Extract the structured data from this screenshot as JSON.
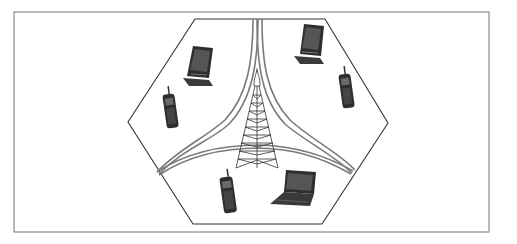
{
  "diagram": {
    "frame": {
      "x": 14,
      "y": 12,
      "w": 475,
      "h": 220,
      "stroke": "#8a8a8a"
    },
    "cell": {
      "shape": "hexagon",
      "points": [
        [
          195,
          19
        ],
        [
          325,
          19
        ],
        [
          388,
          123
        ],
        [
          322,
          224
        ],
        [
          193,
          224
        ],
        [
          128,
          122
        ]
      ],
      "stroke": "#333333"
    },
    "tower": {
      "name": "base-station-tower",
      "apex": [
        257,
        72
      ],
      "base_left": [
        236,
        168
      ],
      "base_right": [
        278,
        168
      ]
    },
    "boundaries": {
      "stroke": "#7a7a7a",
      "description": "three curved double lines dividing the cell into three sectors"
    },
    "devices": [
      {
        "type": "pda",
        "label": "PDA",
        "x": 183,
        "y": 46
      },
      {
        "type": "pda",
        "label": "PDA",
        "x": 296,
        "y": 24
      },
      {
        "type": "cell-phone",
        "label": "Cell phone",
        "x": 162,
        "y": 93
      },
      {
        "type": "cell-phone",
        "label": "Cell phone",
        "x": 338,
        "y": 73
      },
      {
        "type": "cell-phone",
        "label": "Cell phone",
        "x": 219,
        "y": 170
      },
      {
        "type": "laptop",
        "label": "Laptop",
        "x": 270,
        "y": 170
      }
    ],
    "colors": {
      "device_dark": "#2e2e2e",
      "device_mid": "#555555",
      "screen": "#6a6a6a",
      "line": "#333333"
    }
  }
}
